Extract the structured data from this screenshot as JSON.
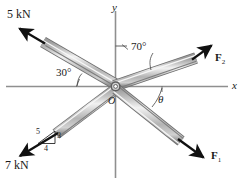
{
  "figure": {
    "axes": {
      "x_label": "x",
      "y_label": "y",
      "origin_label": "O"
    },
    "forces": [
      {
        "id": "force-5kn",
        "label": "5 kN",
        "direction": "upper-left",
        "angle_from_negative_x_deg": 30,
        "magnitude": 5,
        "unit": "kN",
        "known": true
      },
      {
        "id": "force-f2",
        "label": "F",
        "subscript": "2",
        "direction": "upper-right",
        "angle_from_y_axis_deg": 70,
        "known": false
      },
      {
        "id": "force-7kn",
        "label": "7 kN",
        "direction": "lower-left",
        "slope_triangle": {
          "hypotenuse": "5",
          "vertical": "3",
          "horizontal": "4"
        },
        "magnitude": 7,
        "unit": "kN",
        "known": true
      },
      {
        "id": "force-f1",
        "label": "F",
        "subscript": "1",
        "direction": "lower-right",
        "angle_from_positive_x_label": "θ",
        "known": false
      }
    ],
    "angle_labels": [
      {
        "id": "angle-70",
        "text": "70°",
        "measured_between": "y-axis and F2"
      },
      {
        "id": "angle-30",
        "text": "30°",
        "measured_between": "negative x-axis and 5 kN"
      },
      {
        "id": "angle-theta",
        "text": "θ",
        "measured_between": "positive x-axis and F1"
      }
    ],
    "slope_numbers": {
      "hyp": "5",
      "vert": "3",
      "horz": "4"
    },
    "colors": {
      "background": "#ffffff",
      "axis": "#8c8c8c",
      "cable_fill": "#c9c9c9",
      "cable_light": "#efefef",
      "cable_dark": "#9a9a9a",
      "cable_edge": "#6e6e6e",
      "arrow": "#111111",
      "text": "#1a1a1a"
    },
    "caption": ""
  }
}
